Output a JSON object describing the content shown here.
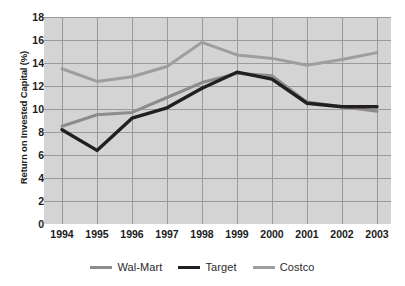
{
  "chart_data": {
    "type": "line",
    "title": "",
    "xlabel": "",
    "ylabel": "Return on Invested Capital (%)",
    "categories": [
      "1994",
      "1995",
      "1996",
      "1997",
      "1998",
      "1999",
      "2000",
      "2001",
      "2002",
      "2003"
    ],
    "x": [
      1994,
      1995,
      1996,
      1997,
      1998,
      1999,
      2000,
      2001,
      2002,
      2003
    ],
    "ylim": [
      0,
      18
    ],
    "yticks": [
      0,
      2,
      4,
      6,
      8,
      10,
      12,
      14,
      16,
      18
    ],
    "ytick_labels": [
      "0",
      "2",
      "4",
      "6",
      "8",
      "10",
      "12",
      "14",
      "16",
      "18"
    ],
    "grid": true,
    "legend_position": "bottom",
    "plot_background": "#d4d4d4",
    "grid_color": "#9a9a9a",
    "series": [
      {
        "name": "Wal-Mart",
        "color": "#8c8c8c",
        "width": 3,
        "values": [
          8.5,
          9.5,
          9.7,
          11.0,
          12.3,
          13.1,
          12.9,
          10.6,
          10.2,
          9.8
        ]
      },
      {
        "name": "Target",
        "color": "#231f20",
        "width": 3.4,
        "values": [
          8.2,
          6.4,
          9.2,
          10.1,
          11.8,
          13.2,
          12.6,
          10.5,
          10.2,
          10.2
        ]
      },
      {
        "name": "Costco",
        "color": "#9e9e9e",
        "width": 3,
        "values": [
          13.5,
          12.4,
          12.8,
          13.7,
          15.8,
          14.7,
          14.4,
          13.8,
          14.3,
          14.9
        ]
      }
    ]
  },
  "legend": {
    "items": [
      {
        "label": "Wal-Mart",
        "color": "#8c8c8c"
      },
      {
        "label": "Target",
        "color": "#231f20"
      },
      {
        "label": "Costco",
        "color": "#9e9e9e"
      }
    ]
  }
}
